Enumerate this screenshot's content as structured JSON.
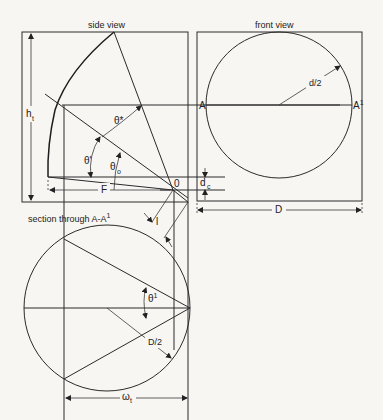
{
  "titles": {
    "side_view": "side view",
    "front_view": "front view",
    "section": "section through A-A",
    "section_sup": "1"
  },
  "labels": {
    "h": "h",
    "h_sub": "t",
    "theta_star": "θ*",
    "theta_prime": "θ'",
    "theta": "θ",
    "theta_sub": "o",
    "F": "F",
    "O": "0",
    "l": "l",
    "A": "A",
    "A1": "A",
    "A1_sup": "1",
    "d_half": "d/2",
    "d": "d",
    "d_sub": "c",
    "D": "D",
    "theta1": "θ",
    "theta1_sup": "1",
    "D_half": "D/2",
    "omega": "ω",
    "omega_sub": "t"
  }
}
